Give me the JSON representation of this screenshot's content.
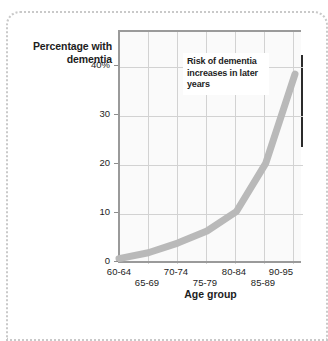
{
  "figure": {
    "y_axis_title": "Percentage with dementia",
    "x_axis_title": "Age group",
    "annotation": "Risk of dementia increases in later years"
  },
  "chart_data": {
    "type": "line",
    "title": "",
    "subtitle": "",
    "xlabel": "Age group",
    "ylabel": "Percentage with dementia",
    "categories": [
      "60-64",
      "65-69",
      "70-74",
      "75-79",
      "80-84",
      "85-89",
      "90-95"
    ],
    "values": [
      0.3,
      1.5,
      3.5,
      6,
      10,
      20,
      38.5
    ],
    "series": [
      {
        "name": "Percentage with dementia",
        "values": [
          0.3,
          1.5,
          3.5,
          6,
          10,
          20,
          38.5
        ],
        "color": "#b9b9b9"
      }
    ],
    "ytick_labels": [
      "0",
      "10",
      "20",
      "30",
      "40%"
    ],
    "ytick_values": [
      0,
      10,
      20,
      30,
      40
    ],
    "ylim": [
      0,
      47
    ],
    "xtick_labels": [
      "60-64",
      "65-69",
      "70-74",
      "75-79",
      "80-84",
      "85-89",
      "90-95"
    ],
    "grid": true,
    "legend": "none",
    "annotations": [
      "Risk of dementia increases in later years"
    ]
  },
  "colors": {
    "series": "#b9b9b9",
    "grid": "#d2d2d2",
    "axis": "#9a9a9a",
    "text": "#1d1d1d",
    "frame": "#c9c9c9",
    "plot_background": "#fafafa"
  }
}
